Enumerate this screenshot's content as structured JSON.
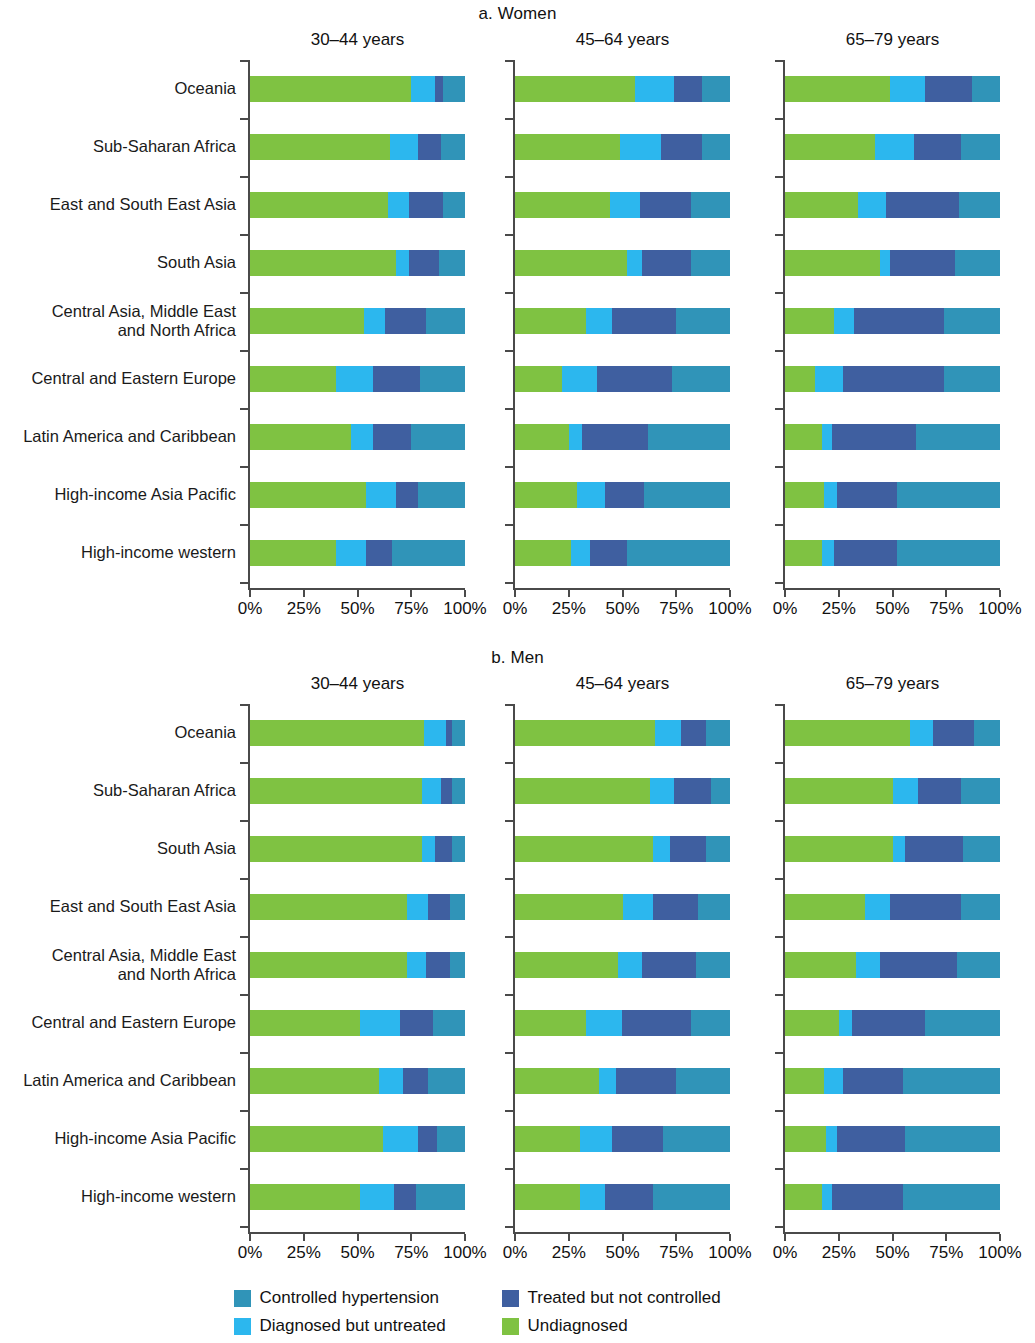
{
  "colors": {
    "controlled": "#3094b8",
    "treated_not_controlled": "#3f5fa0",
    "diagnosed_untreated": "#2cb7ee",
    "undiagnosed": "#7fc242",
    "axis": "#4a4a4a"
  },
  "legend": {
    "items": [
      {
        "label": "Controlled hypertension",
        "color_key": "controlled"
      },
      {
        "label": "Treated but not controlled",
        "color_key": "treated_not_controlled"
      },
      {
        "label": "Diagnosed but untreated",
        "color_key": "diagnosed_untreated"
      },
      {
        "label": "Undiagnosed",
        "color_key": "undiagnosed"
      }
    ]
  },
  "axis": {
    "tick_labels": [
      "0%",
      "25%",
      "50%",
      "75%",
      "100%"
    ],
    "tick_values": [
      0,
      25,
      50,
      75,
      100
    ],
    "min": 0,
    "max": 100
  },
  "panels": {
    "women": {
      "title": "a. Women",
      "columns": [
        "30–44 years",
        "45–64 years",
        "65–79 years"
      ]
    },
    "men": {
      "title": "b. Men",
      "columns": [
        "30–44 years",
        "45–64 years",
        "65–79 years"
      ]
    }
  },
  "chart_data": {
    "type": "bar",
    "orientation": "horizontal",
    "stacked": true,
    "normalized_percent": true,
    "title": "",
    "xlabel": "",
    "ylabel": "",
    "xlim": [
      0,
      100
    ],
    "grid": false,
    "legend_position": "bottom",
    "series": [
      {
        "name": "Undiagnosed",
        "color": "#7fc242"
      },
      {
        "name": "Diagnosed but untreated",
        "color": "#2cb7ee"
      },
      {
        "name": "Treated but not controlled",
        "color": "#3f5fa0"
      },
      {
        "name": "Controlled hypertension",
        "color": "#3094b8"
      }
    ],
    "panels": [
      {
        "panel": "a. Women",
        "age_groups": [
          {
            "age": "30–44 years",
            "categories": [
              "Oceania",
              "Sub-Saharan Africa",
              "East and South East Asia",
              "South Asia",
              "Central Asia, Middle East and North Africa",
              "Central and Eastern Europe",
              "Latin America and Caribbean",
              "High-income Asia Pacific",
              "High-income western"
            ],
            "values": [
              {
                "region": "Oceania",
                "Undiagnosed": 75,
                "Diagnosed but untreated": 11,
                "Treated but not controlled": 4,
                "Controlled hypertension": 10
              },
              {
                "region": "Sub-Saharan Africa",
                "Undiagnosed": 65,
                "Diagnosed but untreated": 13,
                "Treated but not controlled": 11,
                "Controlled hypertension": 11
              },
              {
                "region": "East and South East Asia",
                "Undiagnosed": 64,
                "Diagnosed but untreated": 10,
                "Treated but not controlled": 16,
                "Controlled hypertension": 10
              },
              {
                "region": "South Asia",
                "Undiagnosed": 68,
                "Diagnosed but untreated": 6,
                "Treated but not controlled": 14,
                "Controlled hypertension": 12
              },
              {
                "region": "Central Asia, Middle East and North Africa",
                "Undiagnosed": 53,
                "Diagnosed but untreated": 10,
                "Treated but not controlled": 19,
                "Controlled hypertension": 18
              },
              {
                "region": "Central and Eastern Europe",
                "Undiagnosed": 40,
                "Diagnosed but untreated": 17,
                "Treated but not controlled": 22,
                "Controlled hypertension": 21
              },
              {
                "region": "Latin America and Caribbean",
                "Undiagnosed": 47,
                "Diagnosed but untreated": 10,
                "Treated but not controlled": 18,
                "Controlled hypertension": 25
              },
              {
                "region": "High-income Asia Pacific",
                "Undiagnosed": 54,
                "Diagnosed but untreated": 14,
                "Treated but not controlled": 10,
                "Controlled hypertension": 22
              },
              {
                "region": "High-income western",
                "Undiagnosed": 40,
                "Diagnosed but untreated": 14,
                "Treated but not controlled": 12,
                "Controlled hypertension": 34
              }
            ]
          },
          {
            "age": "45–64 years",
            "categories": [
              "Oceania",
              "Sub-Saharan Africa",
              "East and South East Asia",
              "South Asia",
              "Central Asia, Middle East and North Africa",
              "Central and Eastern Europe",
              "Latin America and Caribbean",
              "High-income Asia Pacific",
              "High-income western"
            ],
            "values": [
              {
                "region": "Oceania",
                "Undiagnosed": 56,
                "Diagnosed but untreated": 18,
                "Treated but not controlled": 13,
                "Controlled hypertension": 13
              },
              {
                "region": "Sub-Saharan Africa",
                "Undiagnosed": 49,
                "Diagnosed but untreated": 19,
                "Treated but not controlled": 19,
                "Controlled hypertension": 13
              },
              {
                "region": "East and South East Asia",
                "Undiagnosed": 44,
                "Diagnosed but untreated": 14,
                "Treated but not controlled": 24,
                "Controlled hypertension": 18
              },
              {
                "region": "South Asia",
                "Undiagnosed": 52,
                "Diagnosed but untreated": 7,
                "Treated but not controlled": 23,
                "Controlled hypertension": 18
              },
              {
                "region": "Central Asia, Middle East and North Africa",
                "Undiagnosed": 33,
                "Diagnosed but untreated": 12,
                "Treated but not controlled": 30,
                "Controlled hypertension": 25
              },
              {
                "region": "Central and Eastern Europe",
                "Undiagnosed": 22,
                "Diagnosed but untreated": 16,
                "Treated but not controlled": 35,
                "Controlled hypertension": 27
              },
              {
                "region": "Latin America and Caribbean",
                "Undiagnosed": 25,
                "Diagnosed but untreated": 6,
                "Treated but not controlled": 31,
                "Controlled hypertension": 38
              },
              {
                "region": "High-income Asia Pacific",
                "Undiagnosed": 29,
                "Diagnosed but untreated": 13,
                "Treated but not controlled": 18,
                "Controlled hypertension": 40
              },
              {
                "region": "High-income western",
                "Undiagnosed": 26,
                "Diagnosed but untreated": 9,
                "Treated but not controlled": 17,
                "Controlled hypertension": 48
              }
            ]
          },
          {
            "age": "65–79 years",
            "categories": [
              "Oceania",
              "Sub-Saharan Africa",
              "East and South East Asia",
              "South Asia",
              "Central Asia, Middle East and North Africa",
              "Central and Eastern Europe",
              "Latin America and Caribbean",
              "High-income Asia Pacific",
              "High-income western"
            ],
            "values": [
              {
                "region": "Oceania",
                "Undiagnosed": 49,
                "Diagnosed but untreated": 16,
                "Treated but not controlled": 22,
                "Controlled hypertension": 13
              },
              {
                "region": "Sub-Saharan Africa",
                "Undiagnosed": 42,
                "Diagnosed but untreated": 18,
                "Treated but not controlled": 22,
                "Controlled hypertension": 18
              },
              {
                "region": "East and South East Asia",
                "Undiagnosed": 34,
                "Diagnosed but untreated": 13,
                "Treated but not controlled": 34,
                "Controlled hypertension": 19
              },
              {
                "region": "South Asia",
                "Undiagnosed": 44,
                "Diagnosed but untreated": 5,
                "Treated but not controlled": 30,
                "Controlled hypertension": 21
              },
              {
                "region": "Central Asia, Middle East and North Africa",
                "Undiagnosed": 23,
                "Diagnosed but untreated": 9,
                "Treated but not controlled": 42,
                "Controlled hypertension": 26
              },
              {
                "region": "Central and Eastern Europe",
                "Undiagnosed": 14,
                "Diagnosed but untreated": 13,
                "Treated but not controlled": 47,
                "Controlled hypertension": 26
              },
              {
                "region": "Latin America and Caribbean",
                "Undiagnosed": 17,
                "Diagnosed but untreated": 5,
                "Treated but not controlled": 39,
                "Controlled hypertension": 39
              },
              {
                "region": "High-income Asia Pacific",
                "Undiagnosed": 18,
                "Diagnosed but untreated": 6,
                "Treated but not controlled": 28,
                "Controlled hypertension": 48
              },
              {
                "region": "High-income western",
                "Undiagnosed": 17,
                "Diagnosed but untreated": 6,
                "Treated but not controlled": 29,
                "Controlled hypertension": 48
              }
            ]
          }
        ]
      },
      {
        "panel": "b. Men",
        "age_groups": [
          {
            "age": "30–44 years",
            "categories": [
              "Oceania",
              "Sub-Saharan Africa",
              "South Asia",
              "East and South East Asia",
              "Central Asia, Middle East and North Africa",
              "Central and Eastern Europe",
              "Latin America and Caribbean",
              "High-income Asia Pacific",
              "High-income western"
            ],
            "values": [
              {
                "region": "Oceania",
                "Undiagnosed": 81,
                "Diagnosed but untreated": 10,
                "Treated but not controlled": 3,
                "Controlled hypertension": 6
              },
              {
                "region": "Sub-Saharan Africa",
                "Undiagnosed": 80,
                "Diagnosed but untreated": 9,
                "Treated but not controlled": 5,
                "Controlled hypertension": 6
              },
              {
                "region": "South Asia",
                "Undiagnosed": 80,
                "Diagnosed but untreated": 6,
                "Treated but not controlled": 8,
                "Controlled hypertension": 6
              },
              {
                "region": "East and South East Asia",
                "Undiagnosed": 73,
                "Diagnosed but untreated": 10,
                "Treated but not controlled": 10,
                "Controlled hypertension": 7
              },
              {
                "region": "Central Asia, Middle East and North Africa",
                "Undiagnosed": 73,
                "Diagnosed but untreated": 9,
                "Treated but not controlled": 11,
                "Controlled hypertension": 7
              },
              {
                "region": "Central and Eastern Europe",
                "Undiagnosed": 51,
                "Diagnosed but untreated": 19,
                "Treated but not controlled": 15,
                "Controlled hypertension": 15
              },
              {
                "region": "Latin America and Caribbean",
                "Undiagnosed": 60,
                "Diagnosed but untreated": 11,
                "Treated but not controlled": 12,
                "Controlled hypertension": 17
              },
              {
                "region": "High-income Asia Pacific",
                "Undiagnosed": 62,
                "Diagnosed but untreated": 16,
                "Treated but not controlled": 9,
                "Controlled hypertension": 13
              },
              {
                "region": "High-income western",
                "Undiagnosed": 51,
                "Diagnosed but untreated": 16,
                "Treated but not controlled": 10,
                "Controlled hypertension": 23
              }
            ]
          },
          {
            "age": "45–64 years",
            "categories": [
              "Oceania",
              "Sub-Saharan Africa",
              "South Asia",
              "East and South East Asia",
              "Central Asia, Middle East and North Africa",
              "Central and Eastern Europe",
              "Latin America and Caribbean",
              "High-income Asia Pacific",
              "High-income western"
            ],
            "values": [
              {
                "region": "Oceania",
                "Undiagnosed": 65,
                "Diagnosed but untreated": 12,
                "Treated but not controlled": 12,
                "Controlled hypertension": 11
              },
              {
                "region": "Sub-Saharan Africa",
                "Undiagnosed": 63,
                "Diagnosed but untreated": 11,
                "Treated but not controlled": 17,
                "Controlled hypertension": 9
              },
              {
                "region": "South Asia",
                "Undiagnosed": 64,
                "Diagnosed but untreated": 8,
                "Treated but not controlled": 17,
                "Controlled hypertension": 11
              },
              {
                "region": "East and South East Asia",
                "Undiagnosed": 50,
                "Diagnosed but untreated": 14,
                "Treated but not controlled": 21,
                "Controlled hypertension": 15
              },
              {
                "region": "Central Asia, Middle East and North Africa",
                "Undiagnosed": 48,
                "Diagnosed but untreated": 11,
                "Treated but not controlled": 25,
                "Controlled hypertension": 16
              },
              {
                "region": "Central and Eastern Europe",
                "Undiagnosed": 33,
                "Diagnosed but untreated": 17,
                "Treated but not controlled": 32,
                "Controlled hypertension": 18
              },
              {
                "region": "Latin America and Caribbean",
                "Undiagnosed": 39,
                "Diagnosed but untreated": 8,
                "Treated but not controlled": 28,
                "Controlled hypertension": 25
              },
              {
                "region": "High-income Asia Pacific",
                "Undiagnosed": 30,
                "Diagnosed but untreated": 15,
                "Treated but not controlled": 24,
                "Controlled hypertension": 31
              },
              {
                "region": "High-income western",
                "Undiagnosed": 30,
                "Diagnosed but untreated": 12,
                "Treated but not controlled": 22,
                "Controlled hypertension": 36
              }
            ]
          },
          {
            "age": "65–79 years",
            "categories": [
              "Oceania",
              "Sub-Saharan Africa",
              "South Asia",
              "East and South East Asia",
              "Central Asia, Middle East and North Africa",
              "Central and Eastern Europe",
              "Latin America and Caribbean",
              "High-income Asia Pacific",
              "High-income western"
            ],
            "values": [
              {
                "region": "Oceania",
                "Undiagnosed": 58,
                "Diagnosed but untreated": 11,
                "Treated but not controlled": 19,
                "Controlled hypertension": 12
              },
              {
                "region": "Sub-Saharan Africa",
                "Undiagnosed": 50,
                "Diagnosed but untreated": 12,
                "Treated but not controlled": 20,
                "Controlled hypertension": 18
              },
              {
                "region": "South Asia",
                "Undiagnosed": 50,
                "Diagnosed but untreated": 6,
                "Treated but not controlled": 27,
                "Controlled hypertension": 17
              },
              {
                "region": "East and South East Asia",
                "Undiagnosed": 37,
                "Diagnosed but untreated": 12,
                "Treated but not controlled": 33,
                "Controlled hypertension": 18
              },
              {
                "region": "Central Asia, Middle East and North Africa",
                "Undiagnosed": 33,
                "Diagnosed but untreated": 11,
                "Treated but not controlled": 36,
                "Controlled hypertension": 20
              },
              {
                "region": "Central and Eastern Europe",
                "Undiagnosed": 25,
                "Diagnosed but untreated": 6,
                "Treated but not controlled": 34,
                "Controlled hypertension": 35
              },
              {
                "region": "Latin America and Caribbean",
                "Undiagnosed": 18,
                "Diagnosed but untreated": 9,
                "Treated but not controlled": 28,
                "Controlled hypertension": 45
              },
              {
                "region": "High-income Asia Pacific",
                "Undiagnosed": 19,
                "Diagnosed but untreated": 5,
                "Treated but not controlled": 32,
                "Controlled hypertension": 44
              },
              {
                "region": "High-income western",
                "Undiagnosed": 17,
                "Diagnosed but untreated": 5,
                "Treated but not controlled": 33,
                "Controlled hypertension": 45
              }
            ]
          }
        ]
      }
    ]
  }
}
